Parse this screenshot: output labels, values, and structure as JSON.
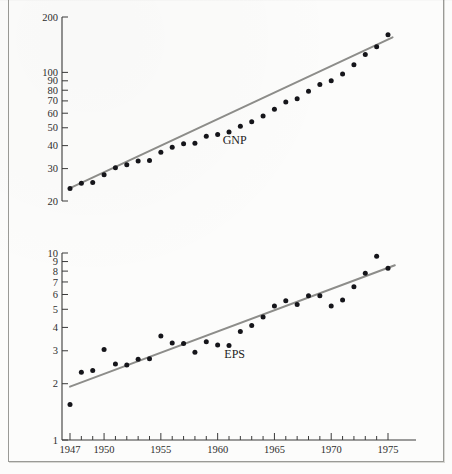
{
  "figure": {
    "top_cut_text": "",
    "background_color": "#fcfcfb",
    "ink_color": "#15151a",
    "fit_line_color": "#8d8d8a"
  },
  "labels": {
    "gnp": "GNP",
    "eps": "EPS"
  },
  "chart_data": {
    "type": "scatter",
    "title": "",
    "subtitle": "",
    "xlabel": "",
    "ylabel": "",
    "scale": "log-y",
    "grid": false,
    "legend": "inline-annotation",
    "xlim": [
      1946.2,
      1978.0
    ],
    "x_ticks": [
      1947,
      1950,
      1955,
      1960,
      1965,
      1970,
      1975
    ],
    "x_tick_labels": [
      "1947",
      "1950",
      "1955",
      "1960",
      "1965",
      "1970",
      "1975"
    ],
    "x_minor_ticks": [
      1947,
      1948,
      1949,
      1950,
      1951,
      1952,
      1953,
      1954,
      1955,
      1956,
      1957,
      1958,
      1959,
      1960,
      1961,
      1962,
      1963,
      1964,
      1965,
      1966,
      1967,
      1968,
      1969,
      1970,
      1971,
      1972,
      1973,
      1974,
      1975
    ],
    "panels": [
      {
        "name": "GNP",
        "annotation": "GNP",
        "annotation_x": 1961.5,
        "annotation_y": 41,
        "ylim": [
          18,
          215
        ],
        "y_ticks": [
          20,
          30,
          40,
          50,
          60,
          70,
          80,
          90,
          100,
          200
        ],
        "y_tick_labels": [
          "20",
          "30",
          "40",
          "50",
          "60",
          "70",
          "80",
          "90",
          "100",
          "200"
        ],
        "fit_line": {
          "x": [
            1947,
            1975.4
          ],
          "y": [
            23.5,
            155
          ]
        },
        "x": [
          1947,
          1948,
          1949,
          1950,
          1951,
          1952,
          1953,
          1954,
          1955,
          1956,
          1957,
          1958,
          1959,
          1960,
          1961,
          1962,
          1963,
          1964,
          1965,
          1966,
          1967,
          1968,
          1969,
          1970,
          1971,
          1972,
          1973,
          1974,
          1975
        ],
        "y": [
          23.4,
          25.0,
          25.2,
          27.8,
          30.3,
          31.5,
          33.0,
          33.2,
          36.8,
          39.2,
          41.0,
          41.2,
          45.0,
          46.0,
          47.5,
          51.0,
          54.0,
          58.0,
          63.0,
          69.0,
          72.0,
          79.0,
          86.0,
          90.0,
          98.0,
          110.0,
          125.0,
          138.0,
          160.0
        ]
      },
      {
        "name": "EPS",
        "annotation": "EPS",
        "annotation_x": 1961.5,
        "annotation_y": 2.75,
        "ylim": [
          1.0,
          11.5
        ],
        "y_ticks": [
          1,
          2,
          3,
          4,
          5,
          6,
          7,
          8,
          9,
          10
        ],
        "y_tick_labels": [
          "1",
          "2",
          "3",
          "4",
          "5",
          "6",
          "7",
          "8",
          "9",
          "10"
        ],
        "fit_line": {
          "x": [
            1947,
            1975.6
          ],
          "y": [
            1.93,
            8.6
          ]
        },
        "x": [
          1947,
          1948,
          1949,
          1950,
          1951,
          1952,
          1953,
          1954,
          1955,
          1956,
          1957,
          1958,
          1959,
          1960,
          1961,
          1962,
          1963,
          1964,
          1965,
          1966,
          1967,
          1968,
          1969,
          1970,
          1971,
          1972,
          1973,
          1974,
          1975
        ],
        "y": [
          1.55,
          2.3,
          2.35,
          3.05,
          2.55,
          2.52,
          2.7,
          2.72,
          3.6,
          3.3,
          3.28,
          2.95,
          3.35,
          3.22,
          3.2,
          3.8,
          4.1,
          4.55,
          5.2,
          5.55,
          5.3,
          5.9,
          5.9,
          5.2,
          5.6,
          6.6,
          7.8,
          9.6,
          8.3
        ]
      }
    ]
  }
}
